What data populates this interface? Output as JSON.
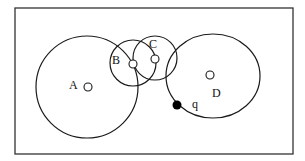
{
  "diagram": {
    "type": "region-overlap diagram",
    "frame": {
      "x": 15,
      "y": 8,
      "width": 278,
      "height": 146,
      "stroke": "#333333"
    },
    "regions": [
      {
        "id": "A",
        "label": "A",
        "cx": 87,
        "cy": 87,
        "r": 51,
        "point": {
          "x": 88,
          "y": 87
        },
        "label_pos": {
          "x": 69,
          "y": 89
        }
      },
      {
        "id": "B",
        "label": "B",
        "cx": 133,
        "cy": 63,
        "r": 23,
        "point": {
          "x": 133,
          "y": 64
        },
        "label_pos": {
          "x": 112,
          "y": 64
        }
      },
      {
        "id": "C",
        "label": "C",
        "cx": 155,
        "cy": 58,
        "r": 22,
        "point": {
          "x": 155,
          "y": 59
        },
        "label_pos": {
          "x": 149,
          "y": 48
        }
      },
      {
        "id": "D",
        "label": "D",
        "cx": 213,
        "cy": 76,
        "rx": 47,
        "ry": 42,
        "point": {
          "x": 210,
          "y": 75
        },
        "label_pos": {
          "x": 212,
          "y": 97
        }
      }
    ],
    "query_point": {
      "label": "q",
      "x": 177,
      "y": 105,
      "r": 4.5,
      "fill": "#000000",
      "label_pos": {
        "x": 192,
        "y": 108
      }
    }
  }
}
